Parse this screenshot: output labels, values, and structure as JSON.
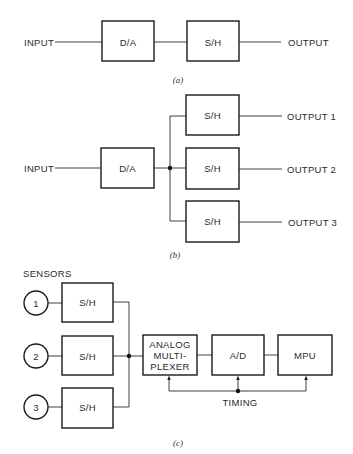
{
  "diagram_a": {
    "caption": "(a)",
    "input_label": "INPUT",
    "output_label": "OUTPUT",
    "blocks": [
      {
        "id": "da",
        "label": "D/A"
      },
      {
        "id": "sh",
        "label": "S/H"
      }
    ]
  },
  "diagram_b": {
    "caption": "(b)",
    "input_label": "INPUT",
    "blocks": [
      {
        "id": "da",
        "label": "D/A"
      },
      {
        "id": "sh1",
        "label": "S/H"
      },
      {
        "id": "sh2",
        "label": "S/H"
      },
      {
        "id": "sh3",
        "label": "S/H"
      }
    ],
    "outputs": [
      "OUTPUT 1",
      "OUTPUT 2",
      "OUTPUT 3"
    ]
  },
  "diagram_c": {
    "caption": "(c)",
    "sensors_label": "SENSORS",
    "sensors": [
      "1",
      "2",
      "3"
    ],
    "sample_hold_label": "S/H",
    "mux_lines": [
      "ANALOG",
      "MULTI-",
      "PLEXER"
    ],
    "adc_label": "A/D",
    "mpu_label": "MPU",
    "timing_label": "TIMING"
  }
}
